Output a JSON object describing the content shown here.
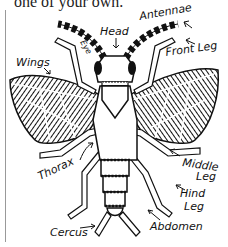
{
  "caption": {
    "partial_text": "one of your own."
  },
  "diagram": {
    "labels": {
      "head": "Head",
      "antennae": "Antennae",
      "eye": "Eye",
      "front_leg": "Front Leg",
      "wings": "Wings",
      "thorax": "Thorax",
      "middle_leg_1": "Middle",
      "middle_leg_2": "Leg",
      "hind_leg_1": "Hind",
      "hind_leg_2": "Leg",
      "abdomen": "Abdomen",
      "cercus": "Cercus"
    }
  }
}
